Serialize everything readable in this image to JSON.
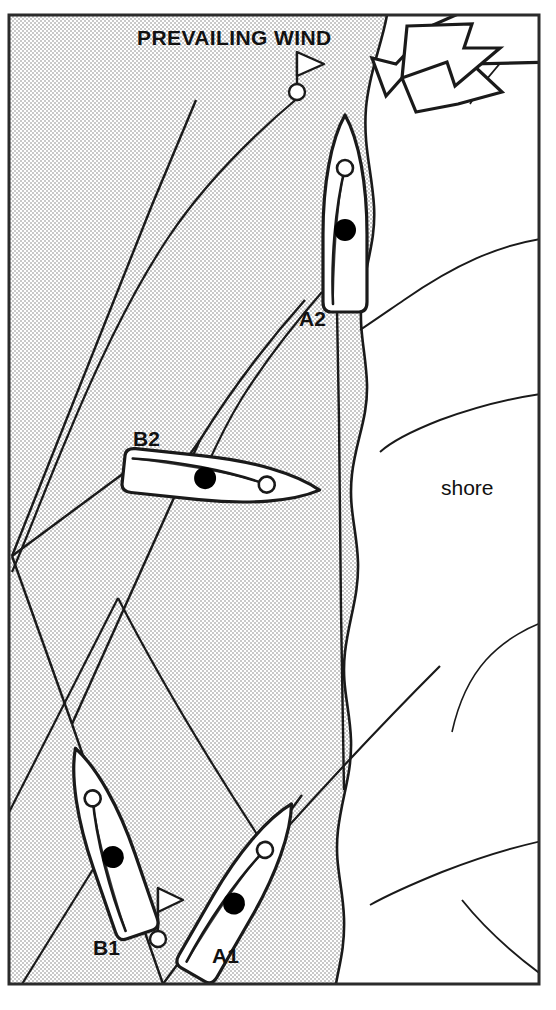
{
  "diagram": {
    "title_text": "PREVAILING WIND",
    "shore_label": "shore",
    "boat_labels": [
      {
        "id": "A2",
        "text": "A2",
        "x": 299,
        "y": 326
      },
      {
        "id": "B2",
        "text": "B2",
        "x": 133,
        "y": 446
      },
      {
        "id": "B1",
        "text": "B1",
        "x": 93,
        "y": 955
      },
      {
        "id": "A1",
        "text": "A1",
        "x": 212,
        "y": 963
      }
    ],
    "title_pos": {
      "x": 137,
      "y": 45
    },
    "shore_pos": {
      "x": 441,
      "y": 495
    },
    "colors": {
      "water_fill": "#e3e3e3",
      "land_fill": "#ffffff",
      "stroke": "#1a1a1a",
      "hull_fill": "#ffffff",
      "crew_dot": "#000000",
      "bow_dot": "#ffffff",
      "frame": "#2b2b2b",
      "page_background": "#ffffff"
    },
    "frame": {
      "x": 8,
      "y": 14,
      "width": 532,
      "height": 971
    },
    "legend": {
      "wind_arrow_name": "prevailing wind arrow",
      "buoy_name": "racing mark buoy",
      "crew_dot_name": "helmsman position",
      "bow_dot_name": "crew position",
      "track_name": "boat track line"
    },
    "buoys": [
      {
        "id": "windward-mark",
        "x": 297,
        "y": 92
      },
      {
        "id": "leeward-mark",
        "x": 158,
        "y": 939
      }
    ],
    "boats": [
      {
        "id": "A2",
        "heading_deg": 0,
        "cx": 345,
        "cy": 212
      },
      {
        "id": "B2",
        "heading_deg": 95,
        "cx": 223,
        "cy": 480
      },
      {
        "id": "B1",
        "heading_deg": 340,
        "cx": 107,
        "cy": 840
      },
      {
        "id": "A1",
        "heading_deg": 28,
        "cx": 243,
        "cy": 885
      }
    ]
  }
}
